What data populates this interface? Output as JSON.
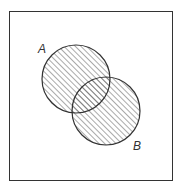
{
  "diagram": {
    "type": "venn",
    "universe": {
      "x": 9,
      "y": 11,
      "width": 163,
      "height": 169
    },
    "sets": [
      {
        "label": "A",
        "cx": 76,
        "cy": 79,
        "r": 34,
        "label_x": 38,
        "label_y": 53
      },
      {
        "label": "B",
        "cx": 106,
        "cy": 111,
        "r": 34,
        "label_x": 133,
        "label_y": 150
      }
    ],
    "shading": "union (A ∪ B) hatched",
    "colors": {
      "stroke": "#333333",
      "hatch": "#555555",
      "background": "#ffffff"
    }
  }
}
